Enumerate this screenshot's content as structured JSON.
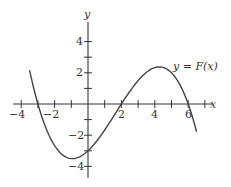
{
  "chart_data": {
    "type": "line",
    "title": "",
    "xlabel": "x",
    "ylabel": "y",
    "xlim": [
      -4.5,
      7.2
    ],
    "ylim": [
      -5,
      5.5
    ],
    "grid": false,
    "x_tick_labels": [
      "-4",
      "-2",
      "2",
      "4",
      "6"
    ],
    "y_tick_labels": [
      "4",
      "2",
      "-2",
      "-4"
    ],
    "x_ticks": [
      -4,
      -3,
      -2,
      -1,
      1,
      2,
      3,
      4,
      5,
      6,
      7
    ],
    "y_ticks": [
      -4,
      -3,
      -2,
      -1,
      1,
      2,
      3,
      4
    ],
    "series": [
      {
        "name": "y = F(x)",
        "x": [
          -3.5,
          -3,
          -2,
          -1,
          0,
          1,
          2,
          3,
          4,
          5,
          6,
          6.5
        ],
        "y": [
          2.2,
          0,
          -2.67,
          -3.5,
          -3,
          -1.33,
          0,
          1.5,
          2.33,
          2.0,
          0,
          -1.8
        ]
      }
    ],
    "annotations": [
      {
        "text": "y = F(x)",
        "x": 4.7,
        "y": 2.6
      }
    ]
  },
  "labels": {
    "x_axis": "x",
    "y_axis": "y",
    "curve": "y = F(x)",
    "xt": [
      "−4",
      "−2",
      "2",
      "4",
      "6"
    ],
    "yt": [
      "4",
      "2",
      "−2",
      "−4"
    ]
  }
}
